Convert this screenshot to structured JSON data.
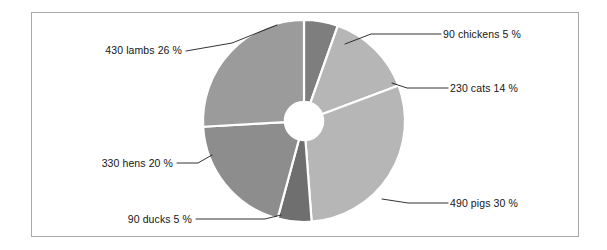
{
  "figure": {
    "background_color": "#ffffff",
    "frame_color": "#a9a9a9",
    "slice_gap_color": "#ffffff",
    "leader_line_color": "#1c1c1c",
    "label_text_color": "#151515"
  },
  "chart_data": {
    "type": "pie",
    "variant": "donut",
    "title": "",
    "subtitle": "",
    "xlabel": "",
    "ylabel": "",
    "legend_position": "none",
    "grid": false,
    "labels_position": "outside-with-leader-lines",
    "total_count": 1660,
    "start_angle_deg": -90,
    "direction": "clockwise",
    "inner_radius_ratio": 0.19,
    "categories": [
      "chickens",
      "cats",
      "pigs",
      "ducks",
      "hens",
      "lambs"
    ],
    "values": [
      90,
      230,
      490,
      90,
      330,
      430
    ],
    "percentages": [
      5,
      14,
      30,
      5,
      20,
      26
    ],
    "colors": [
      "#7e7e7e",
      "#b6b6b6",
      "#b6b6b6",
      "#6f6f6f",
      "#8d8d8d",
      "#9b9b9b"
    ],
    "slices": [
      {
        "name": "chickens",
        "count": 90,
        "percent": 5,
        "color": "#7e7e7e",
        "label": "90 chickens 5 %",
        "label_side": "right"
      },
      {
        "name": "cats",
        "count": 230,
        "percent": 14,
        "color": "#b6b6b6",
        "label": "230 cats 14 %",
        "label_side": "right"
      },
      {
        "name": "pigs",
        "count": 490,
        "percent": 30,
        "color": "#b6b6b6",
        "label": "490 pigs 30 %",
        "label_side": "right"
      },
      {
        "name": "ducks",
        "count": 90,
        "percent": 5,
        "color": "#6f6f6f",
        "label": "90 ducks 5 %",
        "label_side": "left"
      },
      {
        "name": "hens",
        "count": 330,
        "percent": 20,
        "color": "#8d8d8d",
        "label": "330 hens 20 %",
        "label_side": "left"
      },
      {
        "name": "lambs",
        "count": 430,
        "percent": 26,
        "color": "#9b9b9b",
        "label": "430 lambs 26 %",
        "label_side": "left"
      }
    ]
  }
}
